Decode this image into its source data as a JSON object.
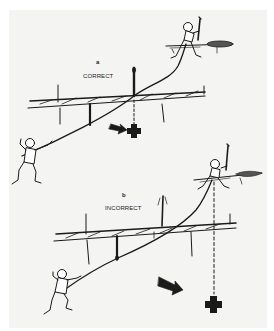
{
  "diagram": {
    "panels": [
      {
        "id": "a",
        "letter": "a",
        "caption": "CORRECT",
        "elements": [
          "climber-top-belayer",
          "climber-bottom-leader",
          "rope",
          "horizontal-log",
          "fall-arrow",
          "fall-point-cross"
        ]
      },
      {
        "id": "b",
        "letter": "b",
        "caption": "INCORRECT",
        "elements": [
          "climber-top-belayer",
          "climber-bottom-leader",
          "rope",
          "horizontal-log",
          "fall-arrow",
          "fall-point-cross"
        ]
      }
    ],
    "colors": {
      "ink": "#1a1a1a",
      "paper": "#f4f4f2",
      "background": "#ffffff"
    }
  }
}
